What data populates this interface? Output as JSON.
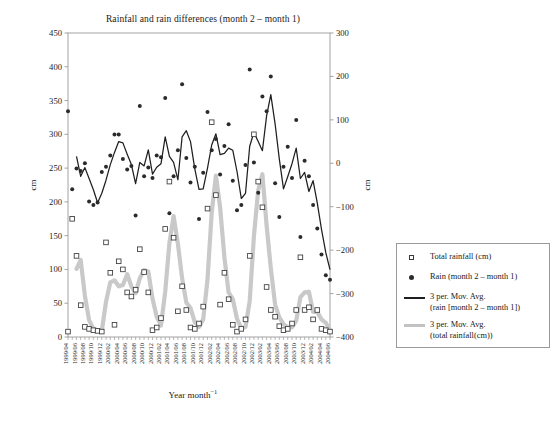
{
  "chart_data": {
    "type": "scatter",
    "title": "Rainfall and rain differences (month 2 – month 1)",
    "xlabel": "Year month",
    "xlabel_sup": "−1",
    "ylabel_left": "cm",
    "ylabel_right": "cm",
    "ylim_left": [
      0,
      450
    ],
    "ylim_right": [
      -400,
      300
    ],
    "yticks_left": [
      0,
      50,
      100,
      150,
      200,
      250,
      300,
      350,
      400,
      450
    ],
    "yticks_right": [
      -400,
      -300,
      -200,
      -100,
      0,
      100,
      200,
      300
    ],
    "grid": false,
    "legend_position": "right",
    "categories": [
      "1999/04",
      "1999/05",
      "1999/06",
      "1999/07",
      "1999/08",
      "1999/09",
      "1999/10",
      "1999/11",
      "1999/12",
      "2000/01",
      "2000/02",
      "2000/03",
      "2000/04",
      "2000/05",
      "2000/06",
      "2000/07",
      "2000/08",
      "2000/09",
      "2000/10",
      "2000/11",
      "2000/12",
      "2001/01",
      "2001/02",
      "2001/03",
      "2001/04",
      "2001/05",
      "2001/06",
      "2001/07",
      "2001/08",
      "2001/09",
      "2001/10",
      "2001/11",
      "2001/12",
      "2002/01",
      "2002/02",
      "2002/03",
      "2002/04",
      "2002/05",
      "2002/06",
      "2002/07",
      "2002/08",
      "2002/09",
      "2002/10",
      "2002/11",
      "2002/12",
      "2003/01",
      "2003/02",
      "2003/03",
      "2003/04",
      "2003/05",
      "2003/06",
      "2003/07",
      "2003/08",
      "2003/09",
      "2003/10",
      "2003/11",
      "2003/12",
      "2004/01",
      "2004/02",
      "2004/03",
      "2004/04",
      "2004/05",
      "2004/06"
    ],
    "xtick_labels": [
      "1999/04",
      "1999/06",
      "1999/08",
      "1999/10",
      "1999/12",
      "2000/02",
      "2000/04",
      "2000/06",
      "2000/08",
      "2000/10",
      "2000/12",
      "2001/02",
      "2001/04",
      "2001/06",
      "2001/08",
      "2001/10",
      "2001/12",
      "2002/02",
      "2002/04",
      "2002/06",
      "2002/08",
      "2002/10",
      "2002/12",
      "2003/02",
      "2003/04",
      "2003/06",
      "2003/08",
      "2003/10",
      "2003/12",
      "2004/02",
      "2004/04",
      "2004/06"
    ],
    "series": [
      {
        "name": "Total rainfall (cm)",
        "marker": "open-square",
        "axis": "left",
        "color": "#3a3a3a",
        "values": [
          8,
          175,
          120,
          47,
          15,
          12,
          10,
          9,
          8,
          140,
          95,
          18,
          112,
          100,
          66,
          60,
          70,
          130,
          96,
          66,
          10,
          14,
          28,
          160,
          230,
          147,
          38,
          75,
          40,
          14,
          12,
          20,
          45,
          190,
          318,
          210,
          48,
          95,
          56,
          18,
          8,
          12,
          26,
          120,
          300,
          230,
          192,
          74,
          40,
          30,
          16,
          10,
          12,
          20,
          40,
          118,
          40,
          44,
          26,
          40,
          12,
          10,
          8
        ]
      },
      {
        "name": "Rain (month 2 – month 1)",
        "marker": "filled-dot",
        "axis": "right",
        "color": "#2b2b2b",
        "values": [
          120,
          -60,
          -12,
          -18,
          0,
          -88,
          -96,
          -90,
          -20,
          -8,
          18,
          66,
          66,
          10,
          -14,
          -6,
          -120,
          132,
          -30,
          -10,
          -34,
          18,
          14,
          150,
          -115,
          -30,
          30,
          182,
          12,
          -44,
          -8,
          -128,
          -22,
          118,
          30,
          56,
          -26,
          40,
          90,
          -40,
          -108,
          -96,
          -4,
          216,
          2,
          -68,
          154,
          120,
          200,
          -46,
          -124,
          -8,
          38,
          -34,
          100,
          -170,
          6,
          -30,
          -96,
          -150,
          -210,
          -258,
          -268
        ]
      },
      {
        "name": "3 per. Mov. Avg.\n(rain [month 2 – month 1])",
        "marker": "line",
        "axis": "right",
        "color": "#1f1f1f",
        "values": [
          null,
          null,
          16,
          -30,
          -10,
          -35,
          -61,
          -91,
          -69,
          -39,
          -3,
          25,
          50,
          47,
          21,
          -3,
          -47,
          2,
          -6,
          31,
          -25,
          -9,
          -1,
          61,
          16,
          2,
          -38,
          61,
          75,
          50,
          -13,
          -60,
          -59,
          -11,
          42,
          68,
          20,
          23,
          35,
          30,
          -19,
          -81,
          -69,
          39,
          71,
          50,
          29,
          109,
          158,
          91,
          10,
          -59,
          -31,
          -1,
          35,
          -35,
          -21,
          -65,
          -40,
          -92,
          -152,
          -206,
          -245
        ]
      },
      {
        "name": "3 per. Mov. Avg.\n(total rainfall(cm))",
        "marker": "thick-line",
        "axis": "left",
        "color": "#c9c9c9",
        "values": [
          null,
          null,
          101,
          114,
          61,
          25,
          12,
          10,
          9,
          52,
          81,
          84,
          75,
          77,
          93,
          75,
          65,
          87,
          99,
          97,
          57,
          30,
          17,
          67,
          139,
          179,
          138,
          87,
          51,
          43,
          22,
          15,
          26,
          85,
          184,
          239,
          192,
          118,
          66,
          56,
          27,
          13,
          15,
          53,
          149,
          217,
          241,
          165,
          102,
          48,
          29,
          19,
          14,
          14,
          24,
          59,
          66,
          67,
          37,
          37,
          26,
          21,
          10
        ]
      }
    ]
  },
  "legend": {
    "items": [
      {
        "label": "Total rainfall (cm)",
        "marker": "open-square"
      },
      {
        "label": "Rain (month 2 – month 1)",
        "marker": "filled-dot"
      },
      {
        "label": "3 per. Mov. Avg.\n(rain [month 2 – month 1])",
        "marker": "dark-line"
      },
      {
        "label": "3 per. Mov. Avg.\n(total rainfall(cm))",
        "marker": "gray-line"
      }
    ]
  }
}
